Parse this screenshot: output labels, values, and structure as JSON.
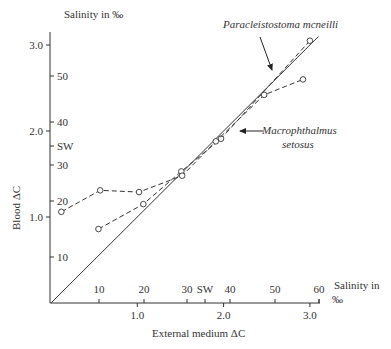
{
  "chart_data": {
    "type": "line",
    "title": "",
    "xlabel": "External medium ΔC",
    "ylabel": "Blood ΔC",
    "x_secondary_label": "Salinity in ‰",
    "y_secondary_label": "Salinity in ‰",
    "xlim": [
      0,
      3.2
    ],
    "ylim": [
      0,
      3.2
    ],
    "x_ticks": [
      "1.0",
      "2.0",
      "3.0"
    ],
    "y_ticks": [
      "1.0",
      "2.0",
      "3.0"
    ],
    "x_salinity_ticks": [
      "10",
      "20",
      "30",
      "SW",
      "40",
      "50",
      "60"
    ],
    "y_salinity_ticks": [
      "10",
      "20",
      "SW",
      "30",
      "40",
      "50"
    ],
    "grid": false,
    "series": [
      {
        "name": "Isosmotic line",
        "style": "solid",
        "x": [
          0,
          3.1
        ],
        "y": [
          0,
          3.1
        ]
      },
      {
        "name": "Paracleistostoma mcneilli",
        "style": "dashed",
        "x": [
          0.55,
          1.07,
          1.51,
          1.97,
          3.0
        ],
        "y": [
          0.86,
          1.15,
          1.53,
          1.91,
          3.05
        ]
      },
      {
        "name": "Macrophthalmus setosus",
        "style": "dashed",
        "x": [
          0.12,
          0.57,
          1.02,
          1.52,
          1.91,
          2.47,
          2.92
        ],
        "y": [
          1.06,
          1.31,
          1.29,
          1.48,
          1.88,
          2.42,
          2.6
        ]
      }
    ],
    "annotations": [
      {
        "text": "Paracleistostoma mcneilli",
        "arrow_to": [
          2.6,
          2.7
        ]
      },
      {
        "text": "Macrophthalmus setosus",
        "arrow_to": [
          2.1,
          2.0
        ]
      }
    ]
  },
  "labels": {
    "y_top": "Salinity in ‰",
    "x_right_1": "Salinity in",
    "x_right_2": "‰",
    "x_bottom": "External medium ΔC",
    "y_left": "Blood ΔC",
    "species1": "Paracleistostoma mcneilli",
    "species2a": "Macrophthalmus",
    "species2b": "setosus"
  }
}
